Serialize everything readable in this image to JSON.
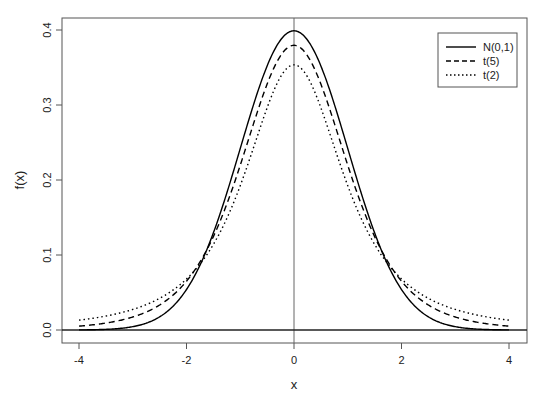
{
  "chart_data": {
    "type": "line",
    "title": "",
    "xlabel": "x",
    "ylabel": "f(x)",
    "xlim": [
      -4.3,
      4.3
    ],
    "ylim": [
      -0.017,
      0.416
    ],
    "x_ticks": [
      -4,
      -2,
      0,
      2,
      4
    ],
    "x_tick_labels": [
      "-4",
      "-2",
      "0",
      "2",
      "4"
    ],
    "y_ticks": [
      0.0,
      0.1,
      0.2,
      0.3,
      0.4
    ],
    "y_tick_labels": [
      "0.0",
      "0.1",
      "0.2",
      "0.3",
      "0.4"
    ],
    "grid": false,
    "reference_lines": {
      "vertical_x": 0,
      "horizontal_y": 0
    },
    "legend_position": "top-right",
    "series": [
      {
        "name": "N(0,1)",
        "dist": "normal",
        "linestyle": "solid",
        "color": "#000000",
        "x": [
          -4,
          -3,
          -2,
          -1,
          0,
          1,
          2,
          3,
          4
        ],
        "values": [
          0.0001,
          0.0044,
          0.054,
          0.242,
          0.399,
          0.242,
          0.054,
          0.0044,
          0.0001
        ]
      },
      {
        "name": "t(5)",
        "dist": "t",
        "df": 5,
        "linestyle": "dashed",
        "color": "#000000",
        "x": [
          -4,
          -3,
          -2,
          -1,
          0,
          1,
          2,
          3,
          4
        ],
        "values": [
          0.0051,
          0.0173,
          0.0651,
          0.2197,
          0.3796,
          0.2197,
          0.0651,
          0.0173,
          0.0051
        ]
      },
      {
        "name": "t(2)",
        "dist": "t",
        "df": 2,
        "linestyle": "dotted",
        "color": "#000000",
        "x": [
          -4,
          -3,
          -2,
          -1,
          0,
          1,
          2,
          3,
          4
        ],
        "values": [
          0.0131,
          0.0275,
          0.068,
          0.1925,
          0.3536,
          0.1925,
          0.068,
          0.0275,
          0.0131
        ]
      }
    ]
  }
}
